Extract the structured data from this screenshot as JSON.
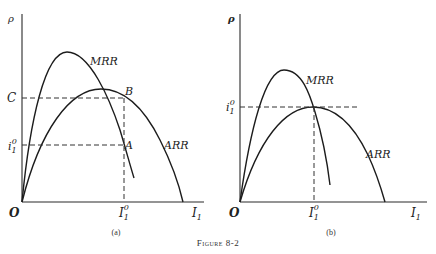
{
  "figure": {
    "caption": "Figure 8-2",
    "panels": [
      {
        "id": "a",
        "label": "(a)",
        "y_axis_label": "ρ",
        "x_axis_label": "I",
        "x_axis_sub": "1",
        "origin_label": "O",
        "curve_labels": {
          "mrr": "MRR",
          "arr": "ARR"
        },
        "points": {
          "A": "A",
          "B": "B",
          "C": "C"
        },
        "i_label": "i",
        "i_sub": "1",
        "i_sup": "0",
        "I_label": "I",
        "I_sub": "1",
        "I_sup": "0"
      },
      {
        "id": "b",
        "label": "(b)",
        "y_axis_label": "ρ",
        "x_axis_label": "I",
        "x_axis_sub": "1",
        "origin_label": "O",
        "curve_labels": {
          "mrr": "MRR",
          "arr": "ARR"
        },
        "i_label": "i",
        "i_sub": "1",
        "i_sup": "0",
        "I_label": "I",
        "I_sub": "1",
        "I_sup": "0"
      }
    ]
  }
}
